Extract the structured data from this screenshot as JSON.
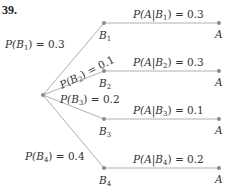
{
  "problem_number": "39.",
  "root": {
    "x": 43,
    "y": 95
  },
  "branches": [
    {
      "node_label": "B",
      "sub": "1",
      "x": 104,
      "y": 23,
      "prior_text": "P(B1) = 0.3",
      "prior": "P(B",
      "prior_sub": "1",
      "prior_val": ") = 0.3",
      "cond_pre": "P(A|B",
      "cond_sub": "1",
      "cond_val": ") = 0.3",
      "a_label": "A",
      "ax": 219
    },
    {
      "node_label": "B",
      "sub": "2",
      "x": 104,
      "y": 71,
      "prior": "P(B",
      "prior_sub": "2",
      "prior_val": ") = 0.1",
      "cond_pre": "P(A|B",
      "cond_sub": "2",
      "cond_val": ") = 0.3",
      "a_label": "A",
      "ax": 219
    },
    {
      "node_label": "B",
      "sub": "3",
      "x": 104,
      "y": 119,
      "prior": "P(B",
      "prior_sub": "3",
      "prior_val": ") = 0.2",
      "cond_pre": "P(A|B",
      "cond_sub": "3",
      "cond_val": ") = 0.1",
      "a_label": "A",
      "ax": 219
    },
    {
      "node_label": "B",
      "sub": "4",
      "x": 104,
      "y": 168,
      "prior": "P(B",
      "prior_sub": "4",
      "prior_val": ") = 0.4",
      "cond_pre": "P(A|B",
      "cond_sub": "4",
      "cond_val": ") = 0.2",
      "a_label": "A",
      "ax": 219
    }
  ]
}
